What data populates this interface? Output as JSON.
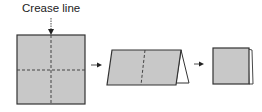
{
  "diagram": {
    "label": "Crease line",
    "steps": [
      {
        "name": "unfolded-square",
        "description": "square with dashed crease lines"
      },
      {
        "name": "folded-tent",
        "description": "folded in half, standing tent"
      },
      {
        "name": "folded-square",
        "description": "folded into quarters"
      }
    ],
    "colors": {
      "fill": "#c8c8c8",
      "stroke": "#333333",
      "crease": "#444444"
    }
  }
}
